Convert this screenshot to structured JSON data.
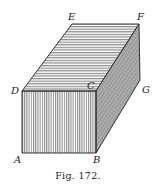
{
  "figure": {
    "caption": "Fig. 172.",
    "vertices": {
      "A": {
        "label": "A",
        "x": 22,
        "y": 153
      },
      "B": {
        "label": "B",
        "x": 96,
        "y": 153
      },
      "C": {
        "label": "C",
        "x": 96,
        "y": 91
      },
      "D": {
        "label": "D",
        "x": 22,
        "y": 91
      },
      "E": {
        "label": "E",
        "x": 72,
        "y": 24
      },
      "F": {
        "label": "F",
        "x": 139,
        "y": 24
      },
      "G": {
        "label": "G",
        "x": 140,
        "y": 80
      }
    },
    "faces": [
      {
        "name": "front",
        "vertices": [
          "A",
          "B",
          "C",
          "D"
        ],
        "hatch": "vertical"
      },
      {
        "name": "top",
        "vertices": [
          "D",
          "C",
          "F",
          "E"
        ],
        "hatch": "horizontal"
      },
      {
        "name": "side",
        "vertices": [
          "B",
          "G",
          "F",
          "C"
        ],
        "hatch": "stippled"
      }
    ]
  }
}
